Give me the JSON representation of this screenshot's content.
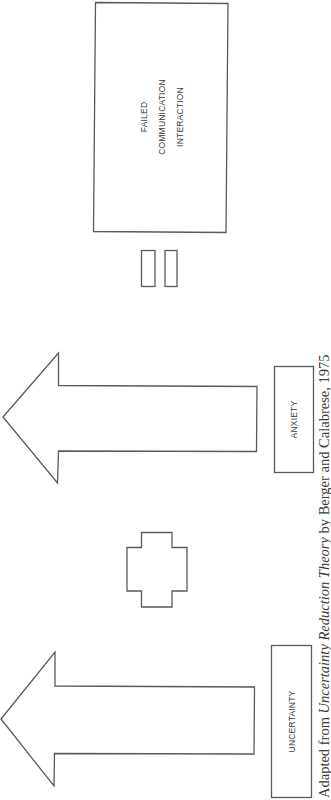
{
  "diagram": {
    "orientation": "rotated 90 degrees counterclockwise",
    "stroke_color": "#5a5a5a",
    "background_color": "#ffffff",
    "result_box": {
      "lines": [
        "FAILED",
        "COMMUNICATION",
        "INTERACTION"
      ]
    },
    "operator_equals": "=",
    "operator_plus": "+",
    "arrow_anxiety": {
      "direction": "up (rotated)",
      "label": "ANXIETY"
    },
    "arrow_uncertainty": {
      "direction": "up (rotated)",
      "label": "UNCERTAINTY"
    },
    "caption": {
      "prefix": "Adapted from ",
      "title": "Uncertainty Reduction Theory",
      "suffix": " by Berger and Calabrese, 1975"
    }
  }
}
